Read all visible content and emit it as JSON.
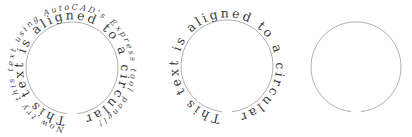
{
  "figures": [
    {
      "id": "panel-1",
      "inner_text": "This text is aligned to a circular arc!",
      "outer_text": "Now try this text using AutoCAD's Express tool panel!"
    },
    {
      "id": "panel-2",
      "inner_text": "This text is aligned to a circular arc!"
    },
    {
      "id": "panel-3",
      "note": "plain circle with small gap at bottom"
    }
  ],
  "colors": {
    "circle_stroke": "#9a9a9a",
    "text": "#3a3a3a",
    "background": "#ffffff"
  }
}
